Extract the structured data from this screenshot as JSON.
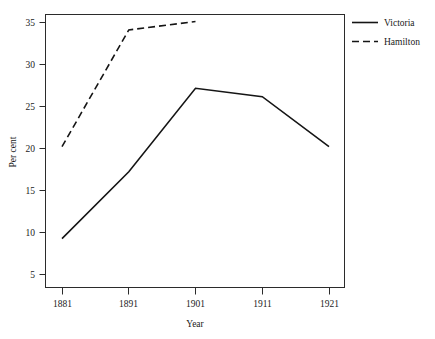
{
  "chart_data": {
    "type": "line",
    "title": "",
    "xlabel": "Year",
    "ylabel": "Per cent",
    "x": [
      1881,
      1891,
      1901,
      1911,
      1921
    ],
    "xtick_labels": [
      "1881",
      "1891",
      "1901",
      "1911",
      "1921"
    ],
    "ytick_labels": [
      "5",
      "10",
      "15",
      "20",
      "25",
      "30",
      "35"
    ],
    "yticks": [
      5,
      10,
      15,
      20,
      25,
      30,
      35
    ],
    "xlim": [
      1877,
      1925
    ],
    "ylim": [
      2,
      36.5
    ],
    "grid": false,
    "legend_position": "right",
    "series": [
      {
        "name": "Victoria",
        "style": "solid",
        "color": "#151515",
        "x": [
          1881,
          1891,
          1901,
          1911,
          1921
        ],
        "values": [
          9,
          17,
          27,
          26,
          20
        ]
      },
      {
        "name": "Hamilton",
        "style": "dashed",
        "color": "#151515",
        "x": [
          1881,
          1891,
          1901
        ],
        "values": [
          20,
          34,
          35
        ]
      }
    ]
  },
  "legend": {
    "entries": [
      {
        "label": "Victoria",
        "style": "solid"
      },
      {
        "label": "Hamilton",
        "style": "dashed"
      }
    ]
  },
  "axes": {
    "y_title": "Per cent",
    "x_title": "Year"
  }
}
